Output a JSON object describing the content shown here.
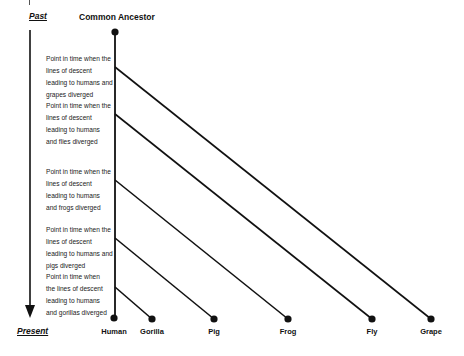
{
  "diagram": {
    "type": "phylogenetic-tree",
    "time_axis": {
      "past_label": "Past",
      "present_label": "Present",
      "direction": "top-to-bottom"
    },
    "root": {
      "label": "Common Ancestor",
      "x": 115,
      "y": 32
    },
    "trunk": {
      "x": 115,
      "y_top": 32,
      "y_bottom": 318
    },
    "taxa": [
      {
        "id": "human",
        "label": "Human",
        "x": 114,
        "y": 318,
        "branch_y": null
      },
      {
        "id": "gorilla",
        "label": "Gorilla",
        "x": 152,
        "y": 319,
        "branch_y": 287
      },
      {
        "id": "pig",
        "label": "Pig",
        "x": 214,
        "y": 319,
        "branch_y": 238
      },
      {
        "id": "frog",
        "label": "Frog",
        "x": 288,
        "y": 319,
        "branch_y": 180
      },
      {
        "id": "fly",
        "label": "Fly",
        "x": 372,
        "y": 319,
        "branch_y": 114
      },
      {
        "id": "grape",
        "label": "Grape",
        "x": 431,
        "y": 319,
        "branch_y": 67
      }
    ],
    "divergence_notes": [
      {
        "id": "grape-note",
        "top": 53,
        "lines": [
          "Point in time when the",
          "lines of descent",
          "leading to humans and",
          "grapes diverged"
        ]
      },
      {
        "id": "fly-note",
        "top": 100,
        "lines": [
          "Point in time when the",
          "lines of descent",
          "leading to humans",
          "and flies diverged"
        ]
      },
      {
        "id": "frog-note",
        "top": 166,
        "lines": [
          "Point in time when the",
          "lines of descent",
          "leading to humans",
          "and frogs diverged"
        ]
      },
      {
        "id": "pig-note",
        "top": 224,
        "lines": [
          "Point in time when the",
          "lines of descent",
          "leading to humans and",
          "pigs diverged"
        ]
      },
      {
        "id": "gorilla-note",
        "top": 271,
        "lines": [
          "Point in time when",
          "the lines of descent",
          "leading to humans",
          "and gorillas diverged"
        ]
      }
    ],
    "colors": {
      "line": "#111111",
      "text": "#111111",
      "background": "#ffffff"
    }
  }
}
